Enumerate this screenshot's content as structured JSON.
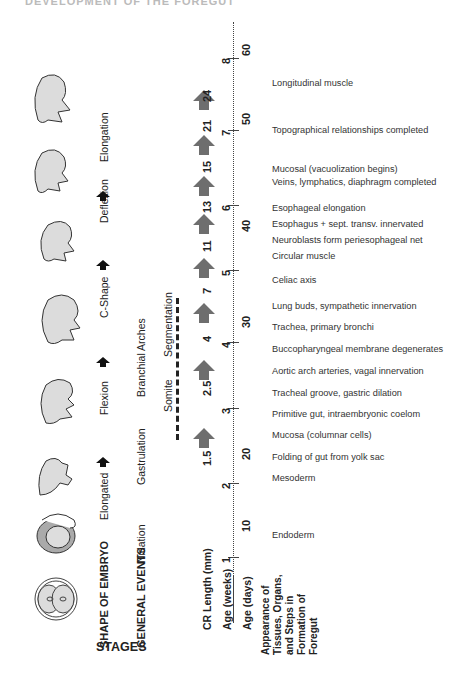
{
  "title_partial": "DEVELOPMENT OF THE FOREGUT",
  "headers": {
    "stages": "STAGES",
    "shape_of_embryo": "SHAPE OF EMBRYO",
    "general_events": "GENERAL EVENTS",
    "cr_length": "CR Length (mm)",
    "age_weeks": "Age (weeks)",
    "age_days": "Age (days)",
    "appearance": [
      "Appearance of",
      "Tissues, Organs,",
      "and Steps in",
      "Formation of",
      "Foregut"
    ]
  },
  "shapes": [
    "Elongated",
    "Flexion",
    "C-Shape",
    "Deflexion",
    "Elongation"
  ],
  "general_events": [
    "Nidation",
    "Gastrulation",
    "Branchial Arches",
    "Somite",
    "Segmentation"
  ],
  "cr_lengths": [
    "1.5",
    "2.5",
    "4",
    "7",
    "11",
    "13",
    "15",
    "21",
    "24"
  ],
  "age_weeks": [
    "1",
    "2",
    "3",
    "4",
    "5",
    "6",
    "7",
    "8"
  ],
  "age_days": [
    "10",
    "20",
    "30",
    "40",
    "50",
    "60"
  ],
  "events": [
    "Longitudinal muscle",
    "Topographical relationships completed",
    "Mucosal (vacuolization begins)",
    "Veins, lymphatics, diaphragm completed",
    "Esophageal elongation",
    "Esophagus + sept. transv. innervated",
    "Neuroblasts form periesophageal net",
    "Circular muscle",
    "Celiac axis",
    "Lung buds, sympathetic innervation",
    "Trachea, primary bronchi",
    "Buccopharyngeal membrane degenerates",
    "Aortic arch arteries, vagal innervation",
    "Tracheal groove, gastric dilation",
    "Primitive gut, intraembryonic coelom",
    "Mucosa (columnar cells)",
    "Folding of gut from yolk sac",
    "Mesoderm",
    "Endoderm"
  ],
  "colors": {
    "arrow_gray": "#6e6e6e",
    "embryo_fill": "#dcdcdc",
    "text": "#222222"
  }
}
